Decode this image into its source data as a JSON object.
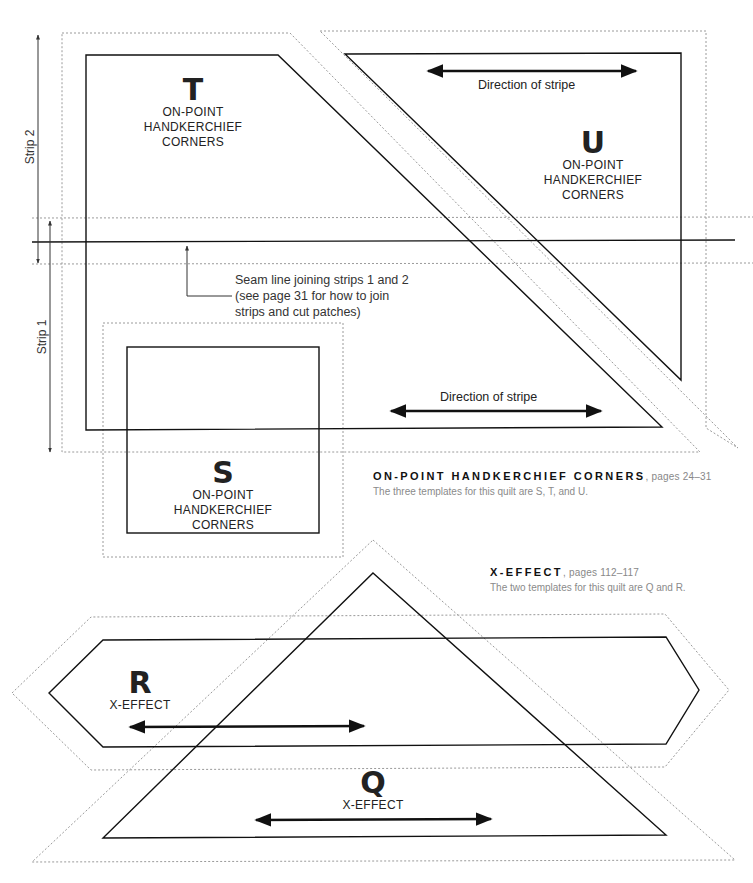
{
  "templates": {
    "T": {
      "letter": "T",
      "lines": [
        "ON-POINT",
        "HANDKERCHIEF",
        "CORNERS"
      ]
    },
    "U": {
      "letter": "U",
      "lines": [
        "ON-POINT",
        "HANDKERCHIEF",
        "CORNERS"
      ]
    },
    "S": {
      "letter": "S",
      "lines": [
        "ON-POINT",
        "HANDKERCHIEF",
        "CORNERS"
      ]
    },
    "R": {
      "letter": "R",
      "lines": [
        "X-EFFECT"
      ]
    },
    "Q": {
      "letter": "Q",
      "lines": [
        "X-EFFECT"
      ]
    }
  },
  "labels": {
    "strip2": "Strip 2",
    "strip1": "Strip 1",
    "direction_top": "Direction of stripe",
    "direction_bottom": "Direction of stripe",
    "seam_note": [
      "Seam line joining strips 1 and 2",
      "(see page 31 for how to join",
      "strips and cut patches)"
    ]
  },
  "captions": {
    "handkerchief": {
      "title": "ON-POINT HANDKERCHIEF CORNERS",
      "pages": ", pages 24–31",
      "desc": "The three templates for this quilt are S, T, and U."
    },
    "xeffect": {
      "title": "X-EFFECT",
      "pages": ", pages 112–117",
      "desc": "The two templates for this quilt are Q and R."
    }
  },
  "colors": {
    "cut_line": "#111111",
    "seam_allowance": "#9a9a9a",
    "caption_gray": "#8a8a8a"
  }
}
